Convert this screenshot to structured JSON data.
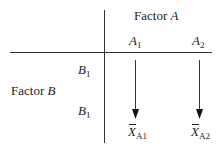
{
  "diagram": {
    "factor_a": {
      "label": "Factor",
      "var": "A"
    },
    "factor_b": {
      "label": "Factor",
      "var": "B"
    },
    "columns": [
      {
        "var": "A",
        "sub": "1"
      },
      {
        "var": "A",
        "sub": "2"
      }
    ],
    "rows": [
      {
        "var": "B",
        "sub": "1"
      },
      {
        "var": "B",
        "sub": "1"
      }
    ],
    "means": [
      {
        "var": "X",
        "sub": "A1"
      },
      {
        "var": "X",
        "sub": "A2"
      }
    ],
    "line_color": "#333333"
  }
}
